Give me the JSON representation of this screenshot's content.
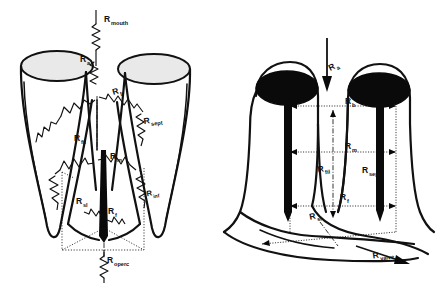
{
  "figure": {
    "background_color": "#ffffff",
    "ink_color": "#111111",
    "panels": [
      {
        "id": "left",
        "view": "frontal schematic with lumped resistor symbols",
        "cap_fill": "#e9e9e9",
        "labels": [
          {
            "base": "R",
            "sub": "mouth",
            "x": 104,
            "y": 22
          },
          {
            "base": "R",
            "sub": "a",
            "x": 86,
            "y": 62
          },
          {
            "base": "R",
            "sub": "b",
            "x": 117,
            "y": 94
          },
          {
            "base": "R",
            "sub": "sept",
            "x": 144,
            "y": 124
          },
          {
            "base": "R",
            "sub": "fil",
            "x": 79,
            "y": 141
          },
          {
            "base": "R",
            "sub": "m",
            "x": 112,
            "y": 160
          },
          {
            "base": "R",
            "sub": "inf",
            "x": 149,
            "y": 196
          },
          {
            "base": "R",
            "sub": "sl",
            "x": 82,
            "y": 204
          },
          {
            "base": "R",
            "sub": "f",
            "x": 104,
            "y": 214
          },
          {
            "base": "R",
            "sub": "operc",
            "x": 103,
            "y": 261
          }
        ]
      },
      {
        "id": "right",
        "view": "three-dimensional perspective with dimension arrows",
        "cap_fill": "#0a0a0a",
        "labels": [
          {
            "base": "R",
            "sub": "a",
            "x": 332,
            "y": 70
          },
          {
            "base": "R",
            "sub": "b",
            "x": 345,
            "y": 104
          },
          {
            "base": "R",
            "sub": "m",
            "x": 345,
            "y": 147
          },
          {
            "base": "R",
            "sub": "fil",
            "x": 320,
            "y": 172
          },
          {
            "base": "R",
            "sub": "sept",
            "x": 366,
            "y": 175
          },
          {
            "base": "R",
            "sub": "f",
            "x": 340,
            "y": 200
          },
          {
            "base": "R",
            "sub": "sl",
            "x": 314,
            "y": 219
          },
          {
            "base": "R",
            "sub": "valve",
            "x": 377,
            "y": 258
          }
        ]
      }
    ],
    "resistances": [
      {
        "symbol": "R_mouth",
        "name": "mouth resistance"
      },
      {
        "symbol": "R_a",
        "name": "anterior resistance"
      },
      {
        "symbol": "R_b",
        "name": "branchial resistance"
      },
      {
        "symbol": "R_sept",
        "name": "septal resistance"
      },
      {
        "symbol": "R_fil",
        "name": "filament resistance"
      },
      {
        "symbol": "R_m",
        "name": "medial resistance"
      },
      {
        "symbol": "R_inf",
        "name": "inferior resistance"
      },
      {
        "symbol": "R_sl",
        "name": "slit resistance"
      },
      {
        "symbol": "R_f",
        "name": "flow resistance"
      },
      {
        "symbol": "R_operc",
        "name": "opercular resistance"
      },
      {
        "symbol": "R_valve",
        "name": "valve resistance"
      }
    ]
  }
}
